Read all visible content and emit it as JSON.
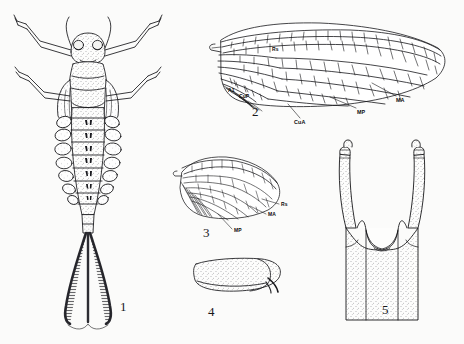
{
  "plate": {
    "title": "Mayfly morphology plate",
    "background_color": "#fbfbfa",
    "ink_color": "#17171a",
    "width": 464,
    "height": 344
  },
  "figures": [
    {
      "number": "1",
      "name": "nymph-dorsal-habitus",
      "caption_x": 120,
      "caption_y": 300
    },
    {
      "number": "2",
      "name": "forewing",
      "caption_x": 252,
      "caption_y": 105
    },
    {
      "number": "3",
      "name": "hindwing",
      "caption_x": 203,
      "caption_y": 226
    },
    {
      "number": "4",
      "name": "abdominal-segment-detail",
      "caption_x": 208,
      "caption_y": 305
    },
    {
      "number": "5",
      "name": "male-genitalia",
      "caption_x": 382,
      "caption_y": 303
    }
  ],
  "forewing_labels": [
    {
      "text": "A1",
      "x": 228,
      "y": 88,
      "name": "vein-label-a1"
    },
    {
      "text": "CuP",
      "x": 239,
      "y": 94,
      "name": "vein-label-cup"
    },
    {
      "text": "CuA",
      "x": 294,
      "y": 120,
      "name": "vein-label-cua"
    },
    {
      "text": "MP",
      "x": 357,
      "y": 110,
      "name": "vein-label-mp"
    },
    {
      "text": "MA",
      "x": 396,
      "y": 98,
      "name": "vein-label-ma"
    },
    {
      "text": "Rs",
      "x": 272,
      "y": 47,
      "name": "vein-label-rs"
    }
  ],
  "hindwing_labels": [
    {
      "text": "Rs",
      "x": 281,
      "y": 202,
      "name": "hindwing-label-rs"
    },
    {
      "text": "MA",
      "x": 268,
      "y": 212,
      "name": "hindwing-label-ma"
    },
    {
      "text": "MP",
      "x": 234,
      "y": 228,
      "name": "hindwing-label-mp"
    }
  ]
}
